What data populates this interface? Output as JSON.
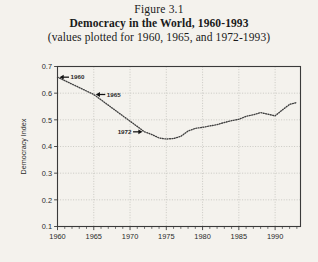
{
  "figure": {
    "number": "Figure 3.1",
    "title": "Democracy in the World, 1960-1993",
    "subtitle": "(values plotted for 1960, 1965, and 1972-1993)"
  },
  "chart_data": {
    "type": "line",
    "title": "Democracy in the World, 1960-1993",
    "subtitle": "(values plotted for 1960, 1965, and 1972-1993)",
    "xlabel": "",
    "ylabel": "Democracy Index",
    "xlim": [
      1960,
      1993.5
    ],
    "ylim": [
      0.1,
      0.7
    ],
    "grid": true,
    "legend": "none",
    "line_style": "dotted",
    "line_color": "#404040",
    "x_tick_labels": [
      "1960",
      "1965",
      "1970",
      "1975",
      "1980",
      "1985",
      "1990"
    ],
    "x_tick_values": [
      1960,
      1965,
      1970,
      1975,
      1980,
      1985,
      1990
    ],
    "x_minor_tick_interval": 1,
    "y_tick_labels": [
      "0.1",
      "0.2",
      "0.3",
      "0.4",
      "0.5",
      "0.6",
      "0.7"
    ],
    "y_tick_values": [
      0.1,
      0.2,
      0.3,
      0.4,
      0.5,
      0.6,
      0.7
    ],
    "x": [
      1960,
      1965,
      1972,
      1973,
      1974,
      1975,
      1976,
      1977,
      1978,
      1979,
      1980,
      1981,
      1982,
      1983,
      1984,
      1985,
      1986,
      1987,
      1988,
      1989,
      1990,
      1991,
      1992,
      1993
    ],
    "values": [
      0.66,
      0.595,
      0.455,
      0.445,
      0.432,
      0.428,
      0.43,
      0.438,
      0.458,
      0.468,
      0.472,
      0.477,
      0.482,
      0.49,
      0.497,
      0.502,
      0.513,
      0.519,
      0.527,
      0.521,
      0.515,
      0.537,
      0.558,
      0.565
    ],
    "annotations": [
      {
        "label": "1960",
        "x": 1960,
        "y": 0.66,
        "arrow": "left",
        "text_side": "right"
      },
      {
        "label": "1965",
        "x": 1965,
        "y": 0.595,
        "arrow": "left",
        "text_side": "right"
      },
      {
        "label": "1972",
        "x": 1972,
        "y": 0.455,
        "arrow": "right",
        "text_side": "left"
      }
    ]
  }
}
